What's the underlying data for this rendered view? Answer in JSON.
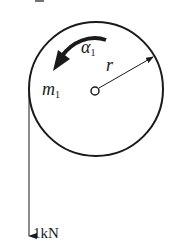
{
  "figure": {
    "top_label": "2",
    "disk": {
      "mass_label": "m",
      "mass_subscript": "1",
      "angular_accel_label": "α",
      "angular_accel_subscript": "1",
      "radius_label": "r"
    },
    "force": {
      "label": "1kN"
    }
  },
  "colors": {
    "stroke": "#1a1a1a",
    "background": "#ffffff"
  }
}
